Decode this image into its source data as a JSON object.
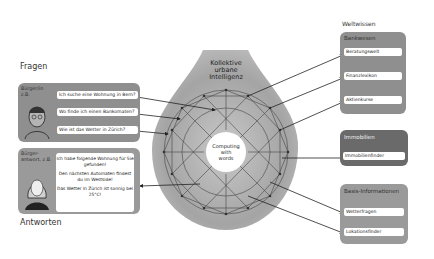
{
  "titles": {
    "questions": "Fragen",
    "answers": "Antworten",
    "world_knowledge": "Weltwissen"
  },
  "center": {
    "title_lines": [
      "Kollektive",
      "urbane",
      "Intelligenz"
    ],
    "core_lines": [
      "Computing",
      "with",
      "words"
    ]
  },
  "citizen_question": {
    "tag_lines": [
      "Bürger/in",
      "z.B."
    ],
    "questions": [
      "Ich suche eine Wohnung in Bern?",
      "Wo finde ich einen Bankomaten?",
      "Wie ist das Wetter in Zürich?"
    ]
  },
  "citizen_answer": {
    "tag_lines": [
      "Bürger-",
      "antwort, z.B."
    ],
    "answers": [
      "Ich habe folgende Wohnung für Sie gefunden!",
      "Den nächsten Automaten findest du im Westside!",
      "Das Wetter in Zürich ist sonnig bei 25°C!"
    ]
  },
  "knowledge_panels": [
    {
      "title": "Bankwesen",
      "items": [
        "Beratungswelt",
        "Finanzlexikon",
        "Aktienkurse"
      ]
    },
    {
      "title": "Immobilien",
      "items": [
        "Immobilienfinder"
      ]
    },
    {
      "title": "Basis-Informationen",
      "items": [
        "Wetterfragen",
        "Lokationsfinder"
      ]
    }
  ],
  "colors": {
    "panel_gray": "#8f8f8f",
    "panel_dark": "#6a6a6a",
    "blob": "#a9a9a9",
    "line": "#333333"
  }
}
